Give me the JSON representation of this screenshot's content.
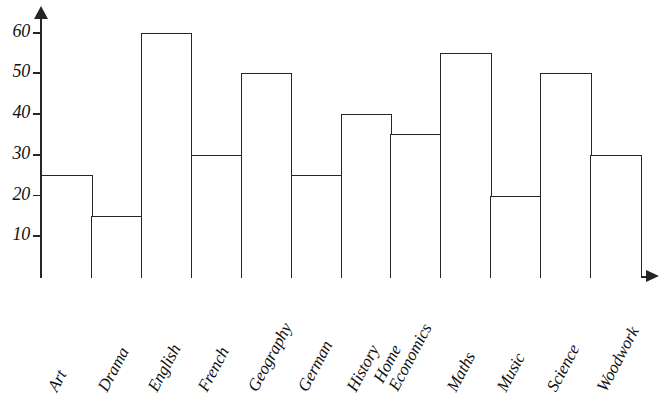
{
  "chart_data": {
    "type": "bar",
    "title": "",
    "subtitle": "",
    "xlabel": "",
    "ylabel": "",
    "categories": [
      "Art",
      "Drama",
      "English",
      "French",
      "Geography",
      "German",
      "History",
      "Home Economics",
      "Maths",
      "Music",
      "Science",
      "Woodwork"
    ],
    "values": [
      25,
      15,
      60,
      30,
      50,
      25,
      40,
      35,
      55,
      20,
      50,
      30
    ],
    "ylim": [
      0,
      65
    ],
    "y_ticks": [
      10,
      20,
      30,
      40,
      50,
      60
    ],
    "y_tick_labels": [
      "10",
      "20",
      "30",
      "40",
      "50",
      "60"
    ],
    "grid": false,
    "legend": false,
    "legend_position": "none",
    "bar_style": "outline",
    "bar_fill": "#ffffff",
    "bar_stroke": "#262626",
    "axis_color": "#262626",
    "background": "#ffffff",
    "axis_arrows": true,
    "bars_adjacent": true,
    "label_rotation_deg": -62,
    "multiline_labels": {
      "Home Economics": [
        "Home",
        "Economics"
      ]
    }
  }
}
